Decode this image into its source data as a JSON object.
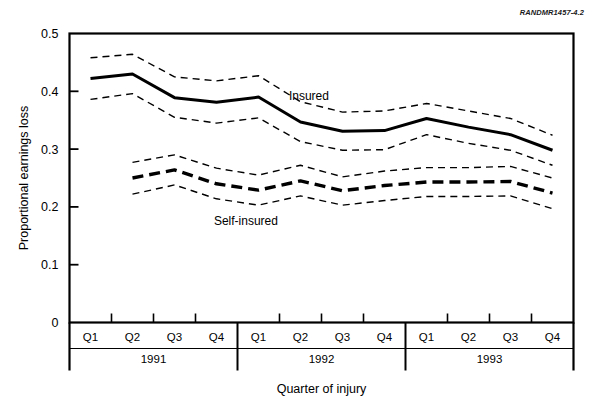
{
  "figure": {
    "code_label": "RANDMR1457-4.2"
  },
  "chart_data": {
    "type": "line",
    "title": "",
    "xlabel": "Quarter of injury",
    "ylabel": "Proportional earnings loss",
    "ylim": [
      0,
      0.5
    ],
    "yticks": [
      0,
      0.1,
      0.2,
      0.3,
      0.4,
      0.5
    ],
    "ytick_labels": [
      "0",
      "0.1",
      "0.2",
      "0.3",
      "0.4",
      "0.5"
    ],
    "grid": false,
    "legend_position": "inline-annotations",
    "categories": [
      "Q1",
      "Q2",
      "Q3",
      "Q4",
      "Q1",
      "Q2",
      "Q3",
      "Q4",
      "Q1",
      "Q2",
      "Q3",
      "Q4"
    ],
    "x_group_labels": [
      "1991",
      "1992",
      "1993"
    ],
    "x_groups": [
      {
        "label": "1991",
        "quarters": [
          "Q1",
          "Q2",
          "Q3",
          "Q4"
        ]
      },
      {
        "label": "1992",
        "quarters": [
          "Q1",
          "Q2",
          "Q3",
          "Q4"
        ]
      },
      {
        "label": "1993",
        "quarters": [
          "Q1",
          "Q2",
          "Q3",
          "Q4"
        ]
      }
    ],
    "annotations": [
      {
        "text": "Insured",
        "x_index": 5.2,
        "y": 0.385
      },
      {
        "text": "Self-insured",
        "x_index": 3.7,
        "y": 0.168
      }
    ],
    "series": [
      {
        "name": "Insured",
        "style": "solid",
        "x": [
          0,
          1,
          2,
          3,
          4,
          5,
          6,
          7,
          8,
          9,
          10,
          11
        ],
        "values": [
          0.422,
          0.43,
          0.389,
          0.381,
          0.39,
          0.347,
          0.331,
          0.332,
          0.353,
          0.338,
          0.325,
          0.298
        ]
      },
      {
        "name": "Insured upper bound",
        "style": "dashed-thin",
        "x": [
          0,
          1,
          2,
          3,
          4,
          5,
          6,
          7,
          8,
          9,
          10,
          11
        ],
        "values": [
          0.458,
          0.464,
          0.425,
          0.418,
          0.427,
          0.382,
          0.364,
          0.366,
          0.379,
          0.366,
          0.353,
          0.324
        ]
      },
      {
        "name": "Insured lower bound",
        "style": "dashed-thin",
        "x": [
          0,
          1,
          2,
          3,
          4,
          5,
          6,
          7,
          8,
          9,
          10,
          11
        ],
        "values": [
          0.386,
          0.396,
          0.355,
          0.345,
          0.354,
          0.313,
          0.298,
          0.299,
          0.325,
          0.31,
          0.298,
          0.272
        ]
      },
      {
        "name": "Self-insured",
        "style": "dashed-bold",
        "x": [
          1,
          2,
          3,
          4,
          5,
          6,
          7,
          8,
          9,
          10,
          11
        ],
        "values": [
          0.25,
          0.264,
          0.24,
          0.229,
          0.245,
          0.228,
          0.237,
          0.243,
          0.243,
          0.244,
          0.224
        ]
      },
      {
        "name": "Self-insured upper bound",
        "style": "dashed-thin",
        "x": [
          1,
          2,
          3,
          4,
          5,
          6,
          7,
          8,
          9,
          10,
          11
        ],
        "values": [
          0.277,
          0.29,
          0.267,
          0.255,
          0.272,
          0.252,
          0.262,
          0.268,
          0.268,
          0.27,
          0.25
        ]
      },
      {
        "name": "Self-insured lower bound",
        "style": "dashed-thin",
        "x": [
          1,
          2,
          3,
          4,
          5,
          6,
          7,
          8,
          9,
          10,
          11
        ],
        "values": [
          0.222,
          0.238,
          0.214,
          0.203,
          0.219,
          0.203,
          0.211,
          0.218,
          0.218,
          0.219,
          0.197
        ]
      }
    ]
  }
}
